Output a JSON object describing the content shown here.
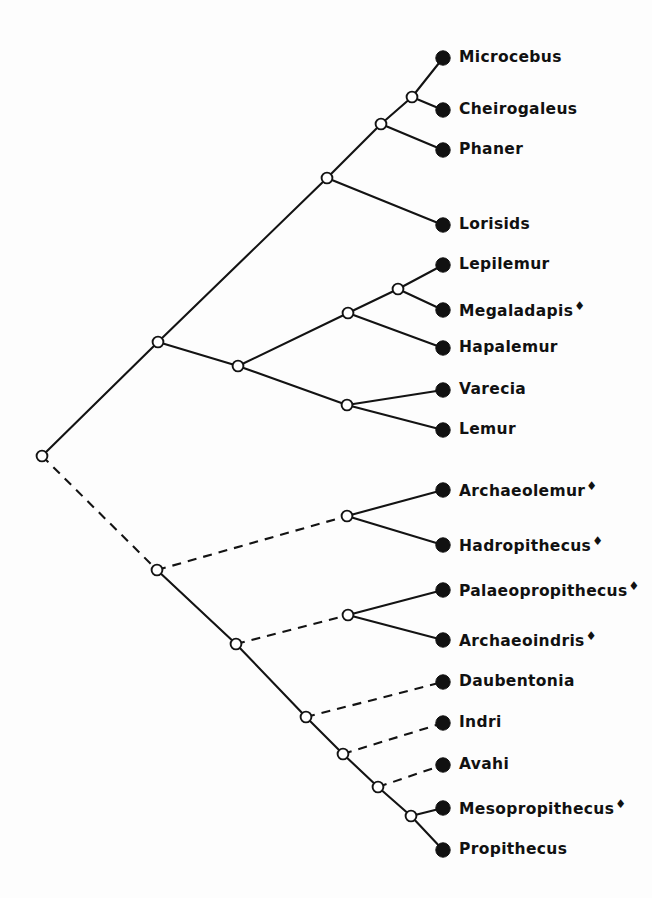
{
  "figure": {
    "type": "cladogram",
    "extinct_marker": "♦",
    "line_color": "#131313",
    "node_fill_internal": "#ffffff",
    "node_fill_tip": "#111111",
    "background": "#ffffff",
    "width": 652,
    "height": 898
  },
  "tips": [
    {
      "id": "microcebus",
      "label": "Microcebus",
      "extinct": false,
      "x": 443,
      "y": 58,
      "label_x": 459
    },
    {
      "id": "cheirogaleus",
      "label": "Cheirogaleus",
      "extinct": false,
      "x": 443,
      "y": 110,
      "label_x": 459
    },
    {
      "id": "phaner",
      "label": "Phaner",
      "extinct": false,
      "x": 443,
      "y": 150,
      "label_x": 459
    },
    {
      "id": "lorisids",
      "label": "Lorisids",
      "extinct": false,
      "x": 443,
      "y": 225,
      "label_x": 459
    },
    {
      "id": "lepilemur",
      "label": "Lepilemur",
      "extinct": false,
      "x": 443,
      "y": 265,
      "label_x": 459
    },
    {
      "id": "megaladapis",
      "label": "Megaladapis",
      "extinct": true,
      "x": 443,
      "y": 310,
      "label_x": 459
    },
    {
      "id": "hapalemur",
      "label": "Hapalemur",
      "extinct": false,
      "x": 443,
      "y": 348,
      "label_x": 459
    },
    {
      "id": "varecia",
      "label": "Varecia",
      "extinct": false,
      "x": 443,
      "y": 390,
      "label_x": 459
    },
    {
      "id": "lemur",
      "label": "Lemur",
      "extinct": false,
      "x": 443,
      "y": 430,
      "label_x": 459
    },
    {
      "id": "archaeolemur",
      "label": "Archaeolemur",
      "extinct": true,
      "x": 443,
      "y": 490,
      "label_x": 459
    },
    {
      "id": "hadropithecus",
      "label": "Hadropithecus",
      "extinct": true,
      "x": 443,
      "y": 545,
      "label_x": 459
    },
    {
      "id": "palaeopropithecus",
      "label": "Palaeopropithecus",
      "extinct": true,
      "x": 443,
      "y": 590,
      "label_x": 459
    },
    {
      "id": "archaeoindris",
      "label": "Archaeoindris",
      "extinct": true,
      "x": 443,
      "y": 640,
      "label_x": 459
    },
    {
      "id": "daubentonia",
      "label": "Daubentonia",
      "extinct": false,
      "x": 443,
      "y": 682,
      "label_x": 459
    },
    {
      "id": "indri",
      "label": "Indri",
      "extinct": false,
      "x": 443,
      "y": 723,
      "label_x": 459
    },
    {
      "id": "avahi",
      "label": "Avahi",
      "extinct": false,
      "x": 443,
      "y": 765,
      "label_x": 459
    },
    {
      "id": "mesopropithecus",
      "label": "Mesopropithecus",
      "extinct": true,
      "x": 443,
      "y": 808,
      "label_x": 459
    },
    {
      "id": "propithecus",
      "label": "Propithecus",
      "extinct": false,
      "x": 443,
      "y": 850,
      "label_x": 459
    }
  ],
  "internal_nodes": [
    {
      "id": "root",
      "x": 42,
      "y": 456
    },
    {
      "id": "upper-clade",
      "x": 158,
      "y": 342
    },
    {
      "id": "cheirogaleoidea",
      "x": 327,
      "y": 178
    },
    {
      "id": "cheirogaleidae",
      "x": 381,
      "y": 124
    },
    {
      "id": "microcebus-pair",
      "x": 412,
      "y": 97
    },
    {
      "id": "lemuridae-stem",
      "x": 238,
      "y": 366
    },
    {
      "id": "lepilemuridae",
      "x": 348,
      "y": 313
    },
    {
      "id": "lepilemur-pair",
      "x": 398,
      "y": 289
    },
    {
      "id": "lemurid-pair",
      "x": 347,
      "y": 405
    },
    {
      "id": "lower-clade",
      "x": 157,
      "y": 570
    },
    {
      "id": "archaeolemurid",
      "x": 347,
      "y": 516
    },
    {
      "id": "indrioid-stem",
      "x": 236,
      "y": 644
    },
    {
      "id": "palaeoprop-pair",
      "x": 348,
      "y": 615
    },
    {
      "id": "daubentonia-node",
      "x": 306,
      "y": 717
    },
    {
      "id": "indri-node",
      "x": 343,
      "y": 754
    },
    {
      "id": "avahi-node",
      "x": 378,
      "y": 787
    },
    {
      "id": "propithecus-node",
      "x": 411,
      "y": 816
    }
  ],
  "branches": [
    {
      "id": "root-to-upper",
      "from": "root",
      "to": "upper-clade",
      "style": "solid"
    },
    {
      "id": "root-to-lower",
      "from": "root",
      "to": "lower-clade",
      "style": "dashed"
    },
    {
      "id": "upper-to-cheirogaleoidea",
      "from": "upper-clade",
      "to": "cheirogaleoidea",
      "style": "solid"
    },
    {
      "id": "upper-to-lemuridae",
      "from": "upper-clade",
      "to": "lemuridae-stem",
      "style": "solid"
    },
    {
      "id": "cheiro-to-cheirogaleidae",
      "from": "cheirogaleoidea",
      "to": "cheirogaleidae",
      "style": "solid"
    },
    {
      "id": "cheiro-to-lorisids",
      "from": "cheirogaleoidea",
      "to": "lorisids",
      "style": "solid"
    },
    {
      "id": "cheirogaleidae-to-pair",
      "from": "cheirogaleidae",
      "to": "microcebus-pair",
      "style": "solid"
    },
    {
      "id": "cheirogaleidae-to-phaner",
      "from": "cheirogaleidae",
      "to": "phaner",
      "style": "solid"
    },
    {
      "id": "pair-to-microcebus",
      "from": "microcebus-pair",
      "to": "microcebus",
      "style": "solid"
    },
    {
      "id": "pair-to-cheirogaleus",
      "from": "microcebus-pair",
      "to": "cheirogaleus",
      "style": "solid"
    },
    {
      "id": "lemuridae-to-lepilemuridae",
      "from": "lemuridae-stem",
      "to": "lepilemuridae",
      "style": "solid"
    },
    {
      "id": "lemuridae-to-lemurid-pair",
      "from": "lemuridae-stem",
      "to": "lemurid-pair",
      "style": "solid"
    },
    {
      "id": "lepi-to-lepipair",
      "from": "lepilemuridae",
      "to": "lepilemur-pair",
      "style": "solid"
    },
    {
      "id": "lepi-to-hapalemur",
      "from": "lepilemuridae",
      "to": "hapalemur",
      "style": "solid"
    },
    {
      "id": "lepipair-to-lepilemur",
      "from": "lepilemur-pair",
      "to": "lepilemur",
      "style": "solid"
    },
    {
      "id": "lepipair-to-megaladapis",
      "from": "lepilemur-pair",
      "to": "megaladapis",
      "style": "solid"
    },
    {
      "id": "lemuridpair-to-varecia",
      "from": "lemurid-pair",
      "to": "varecia",
      "style": "solid"
    },
    {
      "id": "lemuridpair-to-lemur",
      "from": "lemurid-pair",
      "to": "lemur",
      "style": "solid"
    },
    {
      "id": "lower-to-archaeolemurid",
      "from": "lower-clade",
      "to": "archaeolemurid",
      "style": "dashed"
    },
    {
      "id": "lower-to-indrioid",
      "from": "lower-clade",
      "to": "indrioid-stem",
      "style": "solid"
    },
    {
      "id": "arch-to-archaeolemur",
      "from": "archaeolemurid",
      "to": "archaeolemur",
      "style": "solid"
    },
    {
      "id": "arch-to-hadropithecus",
      "from": "archaeolemurid",
      "to": "hadropithecus",
      "style": "solid"
    },
    {
      "id": "indrioid-to-palaeopair",
      "from": "indrioid-stem",
      "to": "palaeoprop-pair",
      "style": "dashed"
    },
    {
      "id": "indrioid-to-daubnode",
      "from": "indrioid-stem",
      "to": "daubentonia-node",
      "style": "solid"
    },
    {
      "id": "palaeopair-to-palaeo",
      "from": "palaeoprop-pair",
      "to": "palaeopropithecus",
      "style": "solid"
    },
    {
      "id": "palaeopair-to-archindris",
      "from": "palaeoprop-pair",
      "to": "archaeoindris",
      "style": "solid"
    },
    {
      "id": "daubnode-to-daubentonia",
      "from": "daubentonia-node",
      "to": "daubentonia",
      "style": "dashed"
    },
    {
      "id": "daubnode-to-indrinode",
      "from": "daubentonia-node",
      "to": "indri-node",
      "style": "solid"
    },
    {
      "id": "indrinode-to-indri",
      "from": "indri-node",
      "to": "indri",
      "style": "dashed"
    },
    {
      "id": "indrinode-to-avahinode",
      "from": "indri-node",
      "to": "avahi-node",
      "style": "solid"
    },
    {
      "id": "avahinode-to-avahi",
      "from": "avahi-node",
      "to": "avahi",
      "style": "dashed"
    },
    {
      "id": "avahinode-to-propnode",
      "from": "avahi-node",
      "to": "propithecus-node",
      "style": "solid"
    },
    {
      "id": "propnode-to-meso",
      "from": "propithecus-node",
      "to": "mesopropithecus",
      "style": "solid"
    },
    {
      "id": "propnode-to-propithecus",
      "from": "propithecus-node",
      "to": "propithecus",
      "style": "solid"
    }
  ]
}
